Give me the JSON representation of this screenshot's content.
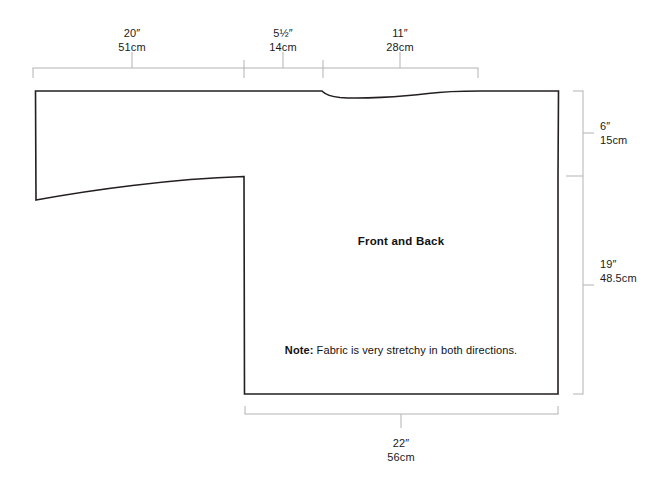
{
  "document": {
    "type": "sewing-pattern-diagram",
    "background_color": "#ffffff",
    "outline_color": "#231f20",
    "dimension_line_color": "#b3b3b3",
    "text_color": "#1a1a1a"
  },
  "piece": {
    "name_label": "Front and Back",
    "note_prefix": "Note:",
    "note_text": " Fabric is very stretchy in both directions."
  },
  "dimensions": {
    "top": [
      {
        "id": "sleeve-width",
        "imperial": "20″",
        "metric": "51cm",
        "tick_x": 132,
        "label_x": 132,
        "label_y": 27,
        "span_start_x": 33,
        "span_end_x": 244
      },
      {
        "id": "shoulder-width",
        "imperial": "5½″",
        "metric": "14cm",
        "tick_x": 283,
        "label_x": 283,
        "label_y": 27,
        "span_start_x": 244,
        "span_end_x": 323
      },
      {
        "id": "neck-to-edge-width",
        "imperial": "11″",
        "metric": "28cm",
        "tick_x": 400,
        "label_x": 400,
        "label_y": 27,
        "span_start_x": 323,
        "span_end_x": 478
      }
    ],
    "right": [
      {
        "id": "armhole-depth",
        "imperial": "6″",
        "metric": "15cm",
        "tick_y": 133,
        "label_x": 600,
        "label_y": 120,
        "span_start_y": 91,
        "span_end_y": 176
      },
      {
        "id": "body-length",
        "imperial": "19″",
        "metric": "48.5cm",
        "tick_y": 285,
        "label_x": 600,
        "label_y": 258,
        "span_start_y": 176,
        "span_end_y": 394
      }
    ],
    "bottom": [
      {
        "id": "body-width",
        "imperial": "22″",
        "metric": "56cm",
        "tick_x": 401,
        "label_x": 401,
        "label_y": 437,
        "span_start_x": 245,
        "span_end_x": 558
      }
    ]
  },
  "geometry": {
    "outline_path": "M 35.5 91 L 36 200 C 90 190 170 179 244 176.5 L 244.5 394 L 558 394 L 558 176 L 558.5 91 L 480 91 C 450 91 440 92 428 93.5 C 400 97 360 99 340 97.5 C 330 96.5 325 94 322.5 91.5 L 322 91 L 140 91 C 100 91 60 91 35.5 91 Z",
    "viewbox": "0 0 664 484"
  }
}
